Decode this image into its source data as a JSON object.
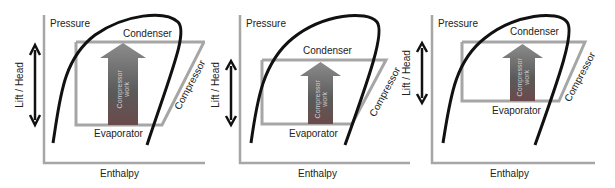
{
  "colors": {
    "curve": "#111111",
    "axis": "#a6a6a6",
    "cycle_box": "#a6a6a6",
    "arrow_top": "#8a8a8a",
    "arrow_bottom": "#4a4a4a",
    "arrow_accent": "#6b4a4a",
    "text": "#222222"
  },
  "panels": [
    {
      "id": "panel-1",
      "y_axis_label": "Pressure",
      "x_axis_label": "Enthalpy",
      "lift_label": "Lift / Head",
      "condenser_label": "Condenser",
      "evaporator_label": "Evaporator",
      "compressor_label": "Compressor",
      "work_label_line1": "Compressor",
      "work_label_line2": "work",
      "lift_size": "large"
    },
    {
      "id": "panel-2",
      "y_axis_label": "Pressure",
      "x_axis_label": "Enthalpy",
      "lift_label": "Lift / Head",
      "condenser_label": "Condenser",
      "evaporator_label": "Evaporator",
      "compressor_label": "Compressor",
      "work_label_line1": "Compressor",
      "work_label_line2": "work",
      "lift_size": "small (higher evaporator)"
    },
    {
      "id": "panel-3",
      "y_axis_label": "Pressure",
      "x_axis_label": "Enthalpy",
      "lift_label": "Lift / Head",
      "condenser_label": "Condenser",
      "evaporator_label": "Evaporator",
      "compressor_label": "Compressor",
      "work_label_line1": "Compressor",
      "work_label_line2": "work",
      "lift_size": "small (lower condenser)"
    }
  ]
}
